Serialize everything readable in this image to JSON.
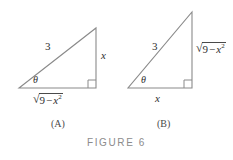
{
  "figure": {
    "caption": "FIGURE 6",
    "background_color": "#ffffff",
    "line_color": "#8a8a8a",
    "text_color": "#2f2f2f",
    "caption_color": "#8c8c8c"
  },
  "panels": [
    {
      "id": "A",
      "panel_label": "(A)",
      "angle_label": "θ",
      "hypotenuse_label": "3",
      "vertical_side": {
        "kind": "plain",
        "text": "x"
      },
      "horizontal_side": {
        "kind": "radical",
        "surd": "√",
        "radicand_number": "9",
        "radicand_operator": "−",
        "radicand_variable": "x",
        "radicand_exponent": "2",
        "text": "√(9 − x²)"
      }
    },
    {
      "id": "B",
      "panel_label": "(B)",
      "angle_label": "θ",
      "hypotenuse_label": "3",
      "vertical_side": {
        "kind": "radical",
        "surd": "√",
        "radicand_number": "9",
        "radicand_operator": "−",
        "radicand_variable": "x",
        "radicand_exponent": "2",
        "text": "√(9 − x²)"
      },
      "horizontal_side": {
        "kind": "plain",
        "text": "x"
      }
    }
  ]
}
